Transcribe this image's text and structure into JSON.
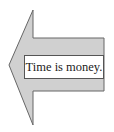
{
  "diagram": {
    "shape": "left-arrow",
    "fill_color": "#d0d0d0",
    "stroke_color": "#666666",
    "label": "Time is money."
  }
}
